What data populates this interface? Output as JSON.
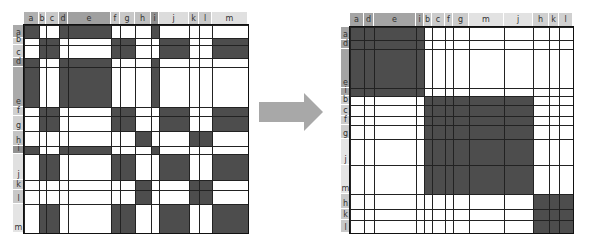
{
  "colors": {
    "fill": "#4d4d4d",
    "empty": "#ffffff",
    "grid": "#222222",
    "arrow": "#a8a8a8"
  },
  "left_matrix": {
    "origin": {
      "x": 24,
      "y": 25
    },
    "header_top": 12,
    "label_left": 13,
    "columns": [
      {
        "label": "a",
        "width": 15,
        "shade": "#b0b0b0"
      },
      {
        "label": "b",
        "width": 7,
        "shade": "#c8c8c8"
      },
      {
        "label": "c",
        "width": 13,
        "shade": "#c8c8c8"
      },
      {
        "label": "d",
        "width": 9,
        "shade": "#a0a0a0"
      },
      {
        "label": "e",
        "width": 43,
        "shade": "#a0a0a0"
      },
      {
        "label": "f",
        "width": 9,
        "shade": "#c8c8c8"
      },
      {
        "label": "g",
        "width": 15,
        "shade": "#c8c8c8"
      },
      {
        "label": "h",
        "width": 16,
        "shade": "#c0c0c0"
      },
      {
        "label": "i",
        "width": 8,
        "shade": "#909090"
      },
      {
        "label": "j",
        "width": 30,
        "shade": "#dcdcdc"
      },
      {
        "label": "k",
        "width": 10,
        "shade": "#c8c8c8"
      },
      {
        "label": "l",
        "width": 13,
        "shade": "#c8c8c8"
      },
      {
        "label": "m",
        "width": 36,
        "shade": "#e0e0e0"
      }
    ],
    "rows": [
      {
        "label": "a",
        "height": 13,
        "shade": "#aaaaaa"
      },
      {
        "label": "b",
        "height": 7,
        "shade": "#d0d0d0"
      },
      {
        "label": "c",
        "height": 13,
        "shade": "#d0d0d0"
      },
      {
        "label": "d",
        "height": 9,
        "shade": "#999999"
      },
      {
        "label": "e",
        "height": 40,
        "shade": "#aaaaaa"
      },
      {
        "label": "f",
        "height": 9,
        "shade": "#d0d0d0"
      },
      {
        "label": "g",
        "height": 15,
        "shade": "#d0d0d0"
      },
      {
        "label": "h",
        "height": 15,
        "shade": "#c4c4c4"
      },
      {
        "label": "i",
        "height": 8,
        "shade": "#909090"
      },
      {
        "label": "j",
        "height": 26,
        "shade": "#e0e0e0"
      },
      {
        "label": "k",
        "height": 10,
        "shade": "#c8c8c8"
      },
      {
        "label": "l",
        "height": 14,
        "shade": "#c8c8c8"
      },
      {
        "label": "m",
        "height": 29,
        "shade": "#e4e4e4"
      }
    ]
  },
  "right_matrix": {
    "origin": {
      "x": 350,
      "y": 27
    },
    "header_top": 13,
    "label_left": 341,
    "columns": [
      {
        "label": "a",
        "width": 14,
        "shade": "#a4a4a4"
      },
      {
        "label": "d",
        "width": 10,
        "shade": "#a4a4a4"
      },
      {
        "label": "e",
        "width": 42,
        "shade": "#a4a4a4"
      },
      {
        "label": "i",
        "width": 8,
        "shade": "#a4a4a4"
      },
      {
        "label": "b",
        "width": 8,
        "shade": "#cccccc"
      },
      {
        "label": "c",
        "width": 13,
        "shade": "#cccccc"
      },
      {
        "label": "f",
        "width": 8,
        "shade": "#cccccc"
      },
      {
        "label": "g",
        "width": 16,
        "shade": "#cccccc"
      },
      {
        "label": "m",
        "width": 35,
        "shade": "#e2e2e2"
      },
      {
        "label": "j",
        "width": 29,
        "shade": "#e2e2e2"
      },
      {
        "label": "h",
        "width": 16,
        "shade": "#d0d0d0"
      },
      {
        "label": "k",
        "width": 10,
        "shade": "#d0d0d0"
      },
      {
        "label": "l",
        "width": 14,
        "shade": "#d0d0d0"
      }
    ],
    "rows": [
      {
        "label": "a",
        "height": 13,
        "shade": "#a4a4a4"
      },
      {
        "label": "d",
        "height": 9,
        "shade": "#a4a4a4"
      },
      {
        "label": "e",
        "height": 39,
        "shade": "#a4a4a4"
      },
      {
        "label": "i",
        "height": 8,
        "shade": "#a4a4a4"
      },
      {
        "label": "b",
        "height": 9,
        "shade": "#cccccc"
      },
      {
        "label": "c",
        "height": 11,
        "shade": "#cccccc"
      },
      {
        "label": "f",
        "height": 9,
        "shade": "#cccccc"
      },
      {
        "label": "g",
        "height": 14,
        "shade": "#cccccc"
      },
      {
        "label": "j",
        "height": 26,
        "shade": "#e4e4e4"
      },
      {
        "label": "m",
        "height": 29,
        "shade": "#e4e4e4"
      },
      {
        "label": "h",
        "height": 15,
        "shade": "#c8c8c8"
      },
      {
        "label": "k",
        "height": 11,
        "shade": "#c8c8c8"
      },
      {
        "label": "l",
        "height": 13,
        "shade": "#c8c8c8"
      }
    ]
  },
  "clusters": [
    [
      "a",
      "d",
      "e",
      "i"
    ],
    [
      "b",
      "c",
      "f",
      "g",
      "j",
      "m"
    ],
    [
      "h",
      "k",
      "l"
    ]
  ],
  "arrow": {
    "direction": "right"
  }
}
